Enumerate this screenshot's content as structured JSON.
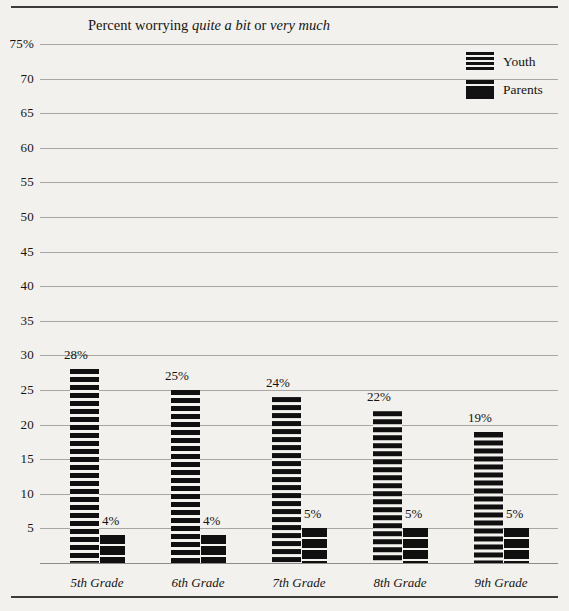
{
  "chart_data": {
    "type": "bar",
    "title": "Percent worrying quite a bit or very much",
    "title_parts": [
      {
        "text": "Percent worrying ",
        "italic": false
      },
      {
        "text": "quite a bit",
        "italic": true
      },
      {
        "text": " or ",
        "italic": false
      },
      {
        "text": "very much",
        "italic": true
      }
    ],
    "xlabel": "",
    "ylabel": "",
    "ylim": [
      0,
      75
    ],
    "grid": true,
    "legend_position": "top-right",
    "categories": [
      "5th Grade",
      "6th Grade",
      "7th Grade",
      "8th Grade",
      "9th Grade"
    ],
    "yticks": [
      "75%",
      "70",
      "65",
      "60",
      "55",
      "50",
      "45",
      "40",
      "35",
      "30",
      "25",
      "20",
      "15",
      "10",
      "5"
    ],
    "ytick_values": [
      75,
      70,
      65,
      60,
      55,
      50,
      45,
      40,
      35,
      30,
      25,
      20,
      15,
      10,
      5
    ],
    "series": [
      {
        "name": "Youth",
        "values": [
          28,
          25,
          24,
          22,
          19
        ],
        "labels": [
          "28%",
          "25%",
          "24%",
          "22%",
          "19%"
        ],
        "pattern": "horizontal-stripes",
        "color": "#101010"
      },
      {
        "name": "Parents",
        "values": [
          4,
          4,
          5,
          5,
          5
        ],
        "labels": [
          "4%",
          "4%",
          "5%",
          "5%",
          "5%"
        ],
        "pattern": "solid-with-thin-white-lines",
        "color": "#101010"
      }
    ]
  },
  "legend": {
    "items": [
      {
        "label": "Youth"
      },
      {
        "label": "Parents"
      }
    ]
  },
  "colors": {
    "background": "#f2f1ee",
    "ink": "#16140f",
    "gridline": "#a8a6a2",
    "rule": "#3b3b3b"
  }
}
